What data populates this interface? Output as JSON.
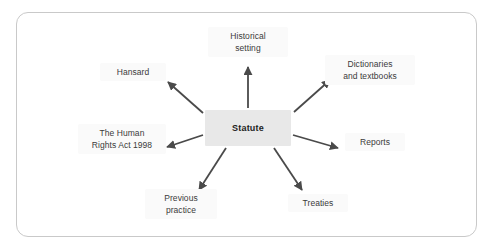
{
  "diagram": {
    "type": "radial-mind-map",
    "center": {
      "label": "Statute"
    },
    "nodes": [
      {
        "id": "historical-setting",
        "label": "Historical\nsetting"
      },
      {
        "id": "dictionaries",
        "label": "Dictionaries\nand textbooks"
      },
      {
        "id": "reports",
        "label": "Reports"
      },
      {
        "id": "treaties",
        "label": "Treaties"
      },
      {
        "id": "previous-practice",
        "label": "Previous\npractice"
      },
      {
        "id": "human-rights-act",
        "label": "The Human\nRights Act 1998"
      },
      {
        "id": "hansard",
        "label": "Hansard"
      }
    ],
    "colors": {
      "center_fill": "#e8e8e8",
      "center_text": "#1e1e1e",
      "node_text": "#3a3a3a",
      "node_fill": "#fafafa",
      "arrow": "#4a4a4a",
      "border": "#c9c9c9",
      "background": "#ffffff"
    }
  }
}
